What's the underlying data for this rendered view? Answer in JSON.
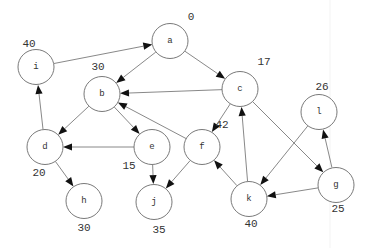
{
  "diagram": {
    "type": "directed-graph",
    "node_radius": 18,
    "colors": {
      "background": "#ffffff",
      "node_stroke": "#6a6a6a",
      "edge": "#6a6a6a",
      "arrowhead": "#111111",
      "text": "#333333"
    },
    "nodes": [
      {
        "id": "a",
        "label": "a",
        "x": 170,
        "y": 41,
        "value": "0",
        "vx": 191,
        "vy": 17
      },
      {
        "id": "i",
        "label": "i",
        "x": 36,
        "y": 67,
        "value": "40",
        "vx": 29,
        "vy": 44
      },
      {
        "id": "b",
        "label": "b",
        "x": 102,
        "y": 94,
        "value": "30",
        "vx": 98,
        "vy": 67
      },
      {
        "id": "c",
        "label": "c",
        "x": 240,
        "y": 89,
        "value": "17",
        "vx": 264,
        "vy": 62
      },
      {
        "id": "l",
        "label": "l",
        "x": 319,
        "y": 112,
        "value": "26",
        "vx": 322,
        "vy": 87
      },
      {
        "id": "d",
        "label": "d",
        "x": 45,
        "y": 147,
        "value": "20",
        "vx": 39,
        "vy": 173
      },
      {
        "id": "e",
        "label": "e",
        "x": 152,
        "y": 147,
        "value": "15",
        "vx": 129,
        "vy": 166
      },
      {
        "id": "f",
        "label": "f",
        "x": 202,
        "y": 147,
        "value": "42",
        "vx": 222,
        "vy": 125
      },
      {
        "id": "g",
        "label": "g",
        "x": 336,
        "y": 185,
        "value": "25",
        "vx": 338,
        "vy": 209
      },
      {
        "id": "h",
        "label": "h",
        "x": 84,
        "y": 201,
        "value": "30",
        "vx": 84,
        "vy": 228
      },
      {
        "id": "j",
        "label": "j",
        "x": 154,
        "y": 202,
        "value": "35",
        "vx": 159,
        "vy": 230
      },
      {
        "id": "k",
        "label": "k",
        "x": 249,
        "y": 199,
        "value": "40",
        "vx": 251,
        "vy": 224
      }
    ],
    "edges": [
      {
        "from": "i",
        "to": "a"
      },
      {
        "from": "a",
        "to": "b"
      },
      {
        "from": "a",
        "to": "c"
      },
      {
        "from": "c",
        "to": "b"
      },
      {
        "from": "f",
        "to": "b"
      },
      {
        "from": "b",
        "to": "d"
      },
      {
        "from": "b",
        "to": "e"
      },
      {
        "from": "c",
        "to": "f"
      },
      {
        "from": "c",
        "to": "g"
      },
      {
        "from": "e",
        "to": "d"
      },
      {
        "from": "e",
        "to": "j"
      },
      {
        "from": "d",
        "to": "i"
      },
      {
        "from": "d",
        "to": "h"
      },
      {
        "from": "f",
        "to": "j"
      },
      {
        "from": "k",
        "to": "f"
      },
      {
        "from": "k",
        "to": "c"
      },
      {
        "from": "l",
        "to": "k"
      },
      {
        "from": "g",
        "to": "k"
      },
      {
        "from": "g",
        "to": "l"
      }
    ]
  }
}
